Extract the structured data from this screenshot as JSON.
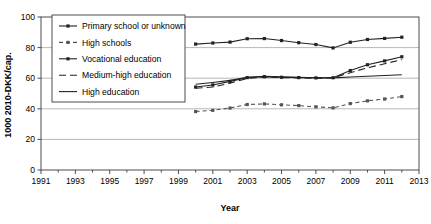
{
  "chart_data": {
    "type": "line",
    "title": "",
    "xlabel": "Year",
    "ylabel": "1000 2010-DKK/cap.",
    "xlim": [
      1991,
      2013
    ],
    "ylim": [
      0,
      100
    ],
    "yticks": [
      0,
      20,
      40,
      60,
      80,
      100
    ],
    "xticks": [
      1991,
      1993,
      1995,
      1997,
      1999,
      2001,
      2003,
      2005,
      2007,
      2009,
      2011,
      2013
    ],
    "xtick_labels": [
      "1991",
      "1993",
      "1995",
      "1997",
      "1999",
      "2001",
      "2003",
      "2005",
      "2007",
      "2009",
      "2011",
      "2013"
    ],
    "ytick_labels": [
      "0",
      "20",
      "40",
      "60",
      "80",
      "100"
    ],
    "grid": "horizontal",
    "legend_position": "upper-left",
    "x": [
      2000,
      2001,
      2002,
      2003,
      2004,
      2005,
      2006,
      2007,
      2008,
      2009,
      2010,
      2011,
      2012
    ],
    "series": [
      {
        "name": "Primary school or unknown",
        "style": "solid-marker",
        "color": "#222222",
        "values": [
          82.3,
          83.0,
          83.6,
          85.8,
          85.9,
          84.6,
          83.2,
          82.0,
          79.8,
          83.5,
          85.3,
          86.0,
          86.8
        ]
      },
      {
        "name": "High schools",
        "style": "dashed-marker",
        "color": "#555555",
        "values": [
          38.2,
          39.0,
          40.5,
          42.8,
          43.2,
          42.6,
          42.1,
          41.3,
          40.6,
          43.4,
          45.2,
          46.4,
          48.0
        ]
      },
      {
        "name": "Vocational education",
        "style": "solid-marker",
        "color": "#222222",
        "values": [
          54.2,
          55.6,
          57.9,
          60.4,
          61.0,
          60.6,
          60.4,
          60.2,
          60.3,
          65.0,
          68.8,
          71.3,
          74.0
        ]
      },
      {
        "name": "Medium-high education",
        "style": "long-dashed",
        "color": "#222222",
        "values": [
          53.4,
          54.2,
          56.8,
          59.8,
          60.8,
          60.4,
          60.2,
          60.0,
          60.2,
          63.6,
          66.8,
          69.4,
          72.2
        ]
      },
      {
        "name": "High education",
        "style": "solid",
        "color": "#222222",
        "values": [
          56.0,
          57.2,
          58.6,
          60.6,
          61.2,
          60.9,
          60.6,
          60.3,
          60.2,
          60.8,
          61.3,
          61.8,
          62.3
        ]
      }
    ]
  },
  "legend": {
    "items": [
      {
        "label": "Primary school or unknown"
      },
      {
        "label": "High schools"
      },
      {
        "label": "Vocational education"
      },
      {
        "label": "Medium-high education"
      },
      {
        "label": "High education"
      }
    ]
  }
}
